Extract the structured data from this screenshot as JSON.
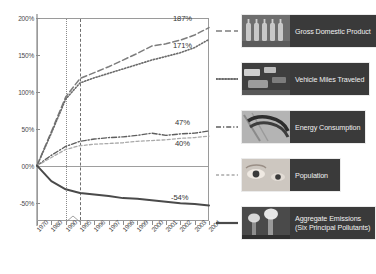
{
  "chart_data": {
    "type": "line",
    "title": "",
    "xlabel": "",
    "ylabel": "",
    "grid": false,
    "legend_position": "right",
    "ylim": [
      -75,
      200
    ],
    "yticks": [
      "200%",
      "150%",
      "100%",
      "50%",
      "00%",
      "-50%"
    ],
    "ytick_values": [
      200,
      150,
      100,
      50,
      0,
      -50
    ],
    "categories": [
      "1970",
      "1980",
      "1990",
      "1995",
      "1996",
      "1997",
      "1998",
      "1999",
      "2000",
      "2001",
      "2002",
      "2003",
      "2004"
    ],
    "annotations": {
      "reference_lines": [
        "1990",
        "1995"
      ],
      "zero_line": "00%"
    },
    "series": [
      {
        "name": "Gross Domestic Product",
        "style": "dashed",
        "color": "#7d7d7d",
        "end_label": "187%",
        "values": [
          0,
          46,
          93,
          118,
          126,
          134,
          143,
          152,
          162,
          165,
          170,
          177,
          187
        ]
      },
      {
        "name": "Vehicle Miles Traveled",
        "style": "dotted",
        "color": "#6b6b6b",
        "end_label": "171%",
        "values": [
          0,
          44,
          90,
          112,
          119,
          125,
          131,
          137,
          143,
          148,
          153,
          160,
          171
        ]
      },
      {
        "name": "Energy Consumption",
        "style": "dash-dot",
        "color": "#5f5f5f",
        "end_label": "47%",
        "values": [
          0,
          14,
          26,
          33,
          36,
          38,
          39,
          41,
          44,
          41,
          43,
          44,
          47
        ]
      },
      {
        "name": "Population",
        "style": "dash-light",
        "color": "#a9a9a9",
        "end_label": "40%",
        "values": [
          0,
          11,
          22,
          27,
          29,
          30,
          31,
          33,
          34,
          35,
          37,
          38,
          40
        ]
      },
      {
        "name": "Aggregate Emissions (Six Principal Pollutants)",
        "style": "solid",
        "color": "#4a4a4a",
        "end_label": "-54%",
        "values": [
          0,
          -21,
          -32,
          -37,
          -39,
          -41,
          -44,
          -45,
          -47,
          -49,
          -51,
          -52,
          -54
        ]
      }
    ]
  },
  "legend": {
    "items": [
      {
        "label_line1": "Gross Domestic Product",
        "label_line2": "",
        "swatch": "dashed-line-swatch",
        "thumb": "bottles-photo"
      },
      {
        "label_line1": "Vehicle Miles Traveled",
        "label_line2": "",
        "swatch": "dotted-line-swatch",
        "thumb": "traffic-photo"
      },
      {
        "label_line1": "Energy Consumption",
        "label_line2": "",
        "swatch": "dash-dot-line-swatch",
        "thumb": "powerline-photo"
      },
      {
        "label_line1": "Population",
        "label_line2": "",
        "swatch": "dash-light-line-swatch",
        "thumb": "eyes-photo"
      },
      {
        "label_line1": "Aggregate Emissions",
        "label_line2": "(Six Principal Pollutants)",
        "swatch": "solid-line-swatch",
        "thumb": "smokestacks-photo"
      }
    ]
  },
  "colors": {
    "frame": "#9a9a9a",
    "axis": "#b9b9b9",
    "text": "#3b3b3b",
    "caption_bg": "#3a3a3a",
    "caption_text": "#f0f0f0"
  }
}
